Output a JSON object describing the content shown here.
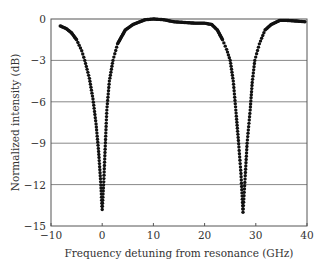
{
  "chart_data": {
    "type": "scatter",
    "title": "",
    "xlabel": "Frequency detuning from resonance (GHz)",
    "ylabel": "Normalized intensity (dB)",
    "xlim": [
      -10,
      40
    ],
    "ylim": [
      -15,
      0
    ],
    "xticks": [
      -10,
      0,
      10,
      20,
      30,
      40
    ],
    "yticks": [
      0,
      -3,
      -6,
      -9,
      -12,
      -15
    ],
    "xtick_labels": [
      "−10",
      "0",
      "10",
      "20",
      "30",
      "40"
    ],
    "ytick_labels": [
      "0",
      "−3",
      "−6",
      "−9",
      "−12",
      "−15"
    ],
    "grid": {
      "horizontal": true,
      "vertical": false
    },
    "legend": null,
    "series": [
      {
        "name": "transmission",
        "marker": "dot",
        "color": "#111111",
        "x": [
          -8.2,
          -7,
          -6,
          -5,
          -4,
          -3.4,
          -2.5,
          -1.8,
          -1.2,
          -0.7,
          -0.3,
          0,
          0.3,
          0.6,
          0.9,
          1.4,
          2.1,
          3,
          4.5,
          6,
          8.4,
          10,
          12,
          14,
          16,
          18,
          20,
          21.4,
          22.5,
          23.5,
          24.3,
          25,
          25.6,
          26.1,
          26.6,
          27.1,
          27.5,
          27.9,
          28.3,
          28.9,
          29.3,
          29.8,
          30.7,
          31.8,
          33,
          34.7,
          36,
          38,
          39.6
        ],
        "y": [
          -0.5,
          -0.7,
          -1.0,
          -1.5,
          -2.3,
          -3.0,
          -4.3,
          -5.8,
          -7.6,
          -9.6,
          -11.8,
          -13.8,
          -11.8,
          -9.2,
          -6.6,
          -4.5,
          -3.0,
          -1.8,
          -0.8,
          -0.4,
          -0.05,
          0.0,
          -0.05,
          -0.2,
          -0.25,
          -0.3,
          -0.3,
          -0.4,
          -0.8,
          -1.5,
          -2.2,
          -3.0,
          -4.5,
          -6.6,
          -8.8,
          -11.2,
          -14.0,
          -11.6,
          -9.0,
          -6.6,
          -4.6,
          -3.0,
          -1.8,
          -0.8,
          -0.4,
          -0.1,
          -0.1,
          -0.15,
          -0.2
        ]
      }
    ],
    "annotations": []
  },
  "plot": {
    "left": 51,
    "top": 19,
    "right": 307,
    "bottom": 226,
    "axis_color": "#555555",
    "grid_color": "#888888",
    "marker_color": "#111111",
    "marker_radius": 1.7
  }
}
